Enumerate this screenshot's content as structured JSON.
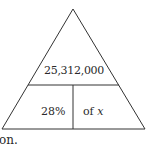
{
  "diagram": {
    "type": "percent-triangle",
    "top_cell": "25,312,000",
    "bottom_left_cell": "28%",
    "bottom_right_cell_prefix": "of ",
    "bottom_right_cell_var": "x",
    "line_color": "#333333"
  },
  "trailing_text": "on."
}
